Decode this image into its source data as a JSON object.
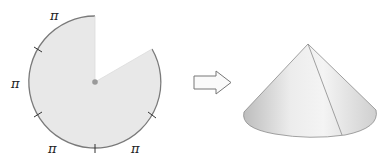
{
  "diagram": {
    "sector": {
      "arc_labels": [
        "π",
        "π",
        "π",
        "π"
      ],
      "tick_marks": 5,
      "fill": "#e6e6e6",
      "stroke": "#888888"
    },
    "arrow": {
      "direction": "right",
      "style": "outline"
    },
    "cone": {
      "has_seam": true
    }
  },
  "labels": {
    "top": "π",
    "left": "π",
    "bottom_left": "π",
    "bottom_right": "π"
  }
}
